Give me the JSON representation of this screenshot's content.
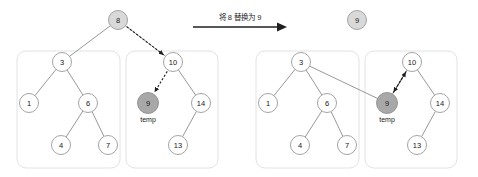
{
  "diagram": {
    "type": "binary-heap-replace-root",
    "transition": {
      "caption": "将 8 替换为 9",
      "arrow_icon": "right-arrow-icon"
    },
    "panels": [
      {
        "id": "before",
        "name": "heap-before",
        "root": {
          "value": "8",
          "shade": "light",
          "cx": 118,
          "cy": 20,
          "r": 9.5
        },
        "boxes": [
          {
            "name": "left-subtree-box",
            "x": 17,
            "y": 51,
            "w": 103,
            "h": 117,
            "rx": 9
          },
          {
            "name": "right-subtree-box",
            "x": 126,
            "y": 51,
            "w": 92,
            "h": 117,
            "rx": 9
          }
        ],
        "nodes": [
          {
            "value": "3",
            "cx": 62,
            "cy": 62,
            "r": 9.5,
            "shade": "none"
          },
          {
            "value": "1",
            "cx": 29,
            "cy": 103,
            "r": 9.5,
            "shade": "none"
          },
          {
            "value": "6",
            "cx": 88,
            "cy": 103,
            "r": 9.5,
            "shade": "none"
          },
          {
            "value": "4",
            "cx": 61,
            "cy": 145,
            "r": 9.5,
            "shade": "none"
          },
          {
            "value": "7",
            "cx": 108,
            "cy": 145,
            "r": 9.5,
            "shade": "none"
          },
          {
            "value": "10",
            "cx": 173,
            "cy": 62,
            "r": 9.5,
            "shade": "none"
          },
          {
            "value": "9",
            "cx": 148,
            "cy": 103,
            "r": 10.5,
            "shade": "dark",
            "caption": "temp"
          },
          {
            "value": "14",
            "cx": 201,
            "cy": 103,
            "r": 9.5,
            "shade": "none"
          },
          {
            "value": "13",
            "cx": 178,
            "cy": 145,
            "r": 9.5,
            "shade": "none"
          }
        ],
        "edges": [
          {
            "from": "8",
            "to": "3",
            "style": "solid"
          },
          {
            "from": "8",
            "to": "10",
            "style": "solid"
          },
          {
            "from": "3",
            "to": "1",
            "style": "solid"
          },
          {
            "from": "3",
            "to": "6",
            "style": "solid"
          },
          {
            "from": "6",
            "to": "4",
            "style": "solid"
          },
          {
            "from": "6",
            "to": "7",
            "style": "solid"
          },
          {
            "from": "10",
            "to": "14",
            "style": "solid"
          },
          {
            "from": "14",
            "to": "13",
            "style": "solid"
          }
        ],
        "pointers": [
          {
            "name": "root-to-right-child-pointer",
            "from": "8",
            "to": "10",
            "style": "dashed"
          },
          {
            "name": "node-to-temp-pointer",
            "from": "10",
            "to": "9",
            "style": "dashed"
          }
        ]
      },
      {
        "id": "after",
        "name": "heap-after",
        "root": {
          "value": "9",
          "shade": "light",
          "cx": 118,
          "cy": 20,
          "r": 9.5
        },
        "boxes": [
          {
            "name": "left-subtree-box",
            "x": 17,
            "y": 51,
            "w": 103,
            "h": 117,
            "rx": 9
          },
          {
            "name": "right-subtree-box",
            "x": 126,
            "y": 51,
            "w": 92,
            "h": 117,
            "rx": 9
          }
        ],
        "nodes": [
          {
            "value": "3",
            "cx": 62,
            "cy": 62,
            "r": 9.5,
            "shade": "none"
          },
          {
            "value": "1",
            "cx": 29,
            "cy": 103,
            "r": 9.5,
            "shade": "none"
          },
          {
            "value": "6",
            "cx": 88,
            "cy": 103,
            "r": 9.5,
            "shade": "none"
          },
          {
            "value": "4",
            "cx": 61,
            "cy": 145,
            "r": 9.5,
            "shade": "none"
          },
          {
            "value": "7",
            "cx": 108,
            "cy": 145,
            "r": 9.5,
            "shade": "none"
          },
          {
            "value": "10",
            "cx": 173,
            "cy": 62,
            "r": 9.5,
            "shade": "none"
          },
          {
            "value": "9",
            "cx": 148,
            "cy": 103,
            "r": 10.5,
            "shade": "dark",
            "caption": "temp"
          },
          {
            "value": "14",
            "cx": 201,
            "cy": 103,
            "r": 9.5,
            "shade": "none"
          },
          {
            "value": "13",
            "cx": 178,
            "cy": 145,
            "r": 9.5,
            "shade": "none"
          }
        ],
        "edges": [
          {
            "from": "9",
            "to": "3",
            "style": "solid"
          },
          {
            "from": "9",
            "to": "10",
            "style": "solid"
          },
          {
            "from": "3",
            "to": "1",
            "style": "solid"
          },
          {
            "from": "3",
            "to": "6",
            "style": "solid"
          },
          {
            "from": "6",
            "to": "4",
            "style": "solid"
          },
          {
            "from": "6",
            "to": "7",
            "style": "solid"
          },
          {
            "from": "10",
            "to": "14",
            "style": "solid"
          },
          {
            "from": "14",
            "to": "13",
            "style": "solid"
          }
        ],
        "pointers": [
          {
            "name": "root-to-right-child-pointer",
            "from": "9",
            "to": "10",
            "style": "dashed"
          },
          {
            "name": "node-to-temp-pointer",
            "from": "10",
            "to": "9",
            "style": "dashed"
          }
        ]
      }
    ],
    "colors": {
      "node_fill": "#ffffff",
      "node_stroke": "#9a9a9a",
      "shade_light": "#d9d9d9",
      "shade_dark": "#a8a8a8",
      "box_stroke": "#e2e2e2",
      "edge": "#8c8c8c",
      "pointer": "#1f1f1f",
      "text": "#1a1a1a",
      "background": "#ffffff"
    }
  }
}
